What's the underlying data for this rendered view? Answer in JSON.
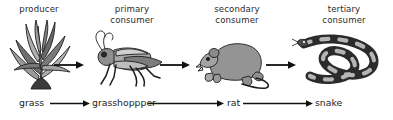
{
  "diagram": {
    "background_color": "#ffffff",
    "ink_color": "#222222"
  },
  "trophic_labels": [
    {
      "line1": "producer",
      "line2": ""
    },
    {
      "line1": "primary",
      "line2": "consumer"
    },
    {
      "line1": "secondary",
      "line2": "consumer"
    },
    {
      "line1": "tertiary",
      "line2": "consumer"
    }
  ],
  "organisms": [
    {
      "name": "grass",
      "icon": "grass-plant-icon"
    },
    {
      "name": "grasshoppper",
      "icon": "grasshopper-icon"
    },
    {
      "name": "rat",
      "icon": "rat-icon"
    },
    {
      "name": "snake",
      "icon": "snake-icon"
    }
  ],
  "chain_names": {
    "grass": "grass",
    "grasshopper": "grasshoppper",
    "rat": "rat",
    "snake": "snake"
  },
  "arrows": {
    "picture_arrow_label": "energy-flow-arrow",
    "chain_arrow_label": "energy-flow-arrow",
    "count_picture_row": 3,
    "count_chain_row": 3
  },
  "palette": {
    "ink": "#222222",
    "dark_gray": "#4a4a4a",
    "mid_gray": "#7d7d7d",
    "light_gray": "#b3b3b3",
    "pale_gray": "#d5d5d5"
  }
}
